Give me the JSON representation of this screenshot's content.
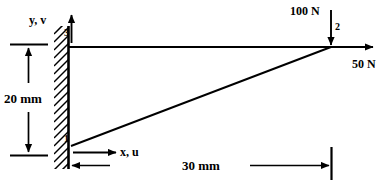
{
  "figure": {
    "type": "engineering-diagram",
    "background_color": "#ffffff",
    "line_color": "#000000"
  },
  "nodes": [
    {
      "id": "1",
      "label": "1",
      "x": 0,
      "y": 0,
      "position_px": {
        "x": 72,
        "y": 145
      }
    },
    {
      "id": "2",
      "label": "2",
      "x": 30,
      "y": 20,
      "position_px": {
        "x": 331,
        "y": 47
      }
    },
    {
      "id": "3",
      "label": "3",
      "x": 0,
      "y": 20,
      "position_px": {
        "x": 72,
        "y": 47
      }
    }
  ],
  "members": [
    {
      "name": "horizontal-member",
      "from": "3",
      "to": "2"
    },
    {
      "name": "diagonal-member",
      "from": "1",
      "to": "2"
    }
  ],
  "support": {
    "name": "fixed-wall",
    "type": "hatched-fixed-support",
    "hatch_angle_deg": 45
  },
  "loads": [
    {
      "name": "vertical-load",
      "label": "100 N",
      "magnitude": 100,
      "unit": "N",
      "direction": "down",
      "applied_at_node": "2"
    },
    {
      "name": "horizontal-load",
      "label": "50 N",
      "magnitude": 50,
      "unit": "N",
      "direction": "right",
      "applied_at_node": "2"
    }
  ],
  "axes": {
    "vertical": {
      "label": "y, v",
      "direction": "up"
    },
    "horizontal": {
      "label": "x, u",
      "direction": "right"
    }
  },
  "dimensions": [
    {
      "name": "height-dimension",
      "label": "20 mm",
      "value": 20,
      "unit": "mm",
      "orientation": "vertical"
    },
    {
      "name": "length-dimension",
      "label": "30 mm",
      "value": 30,
      "unit": "mm",
      "orientation": "horizontal"
    }
  ]
}
